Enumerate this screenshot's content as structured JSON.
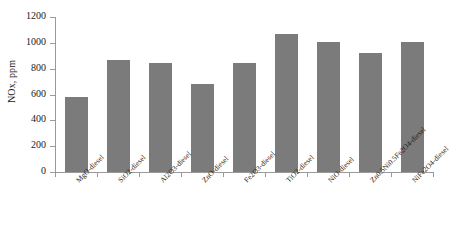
{
  "chart_data": {
    "type": "bar",
    "title": "",
    "subtitle": "",
    "xlabel": "",
    "ylabel": "NOx, ppm",
    "ylim": [
      0,
      1200
    ],
    "ytick_interval": 200,
    "yticks": [
      0,
      200,
      400,
      600,
      800,
      1000,
      1200
    ],
    "ytick_labels": [
      "0",
      "200",
      "400",
      "600",
      "800",
      "1000",
      "1200"
    ],
    "grid": false,
    "legend": false,
    "legend_position": "none",
    "bar_color": "#7b7b7b",
    "axis_color": "#9a9a9a",
    "text_color": "#1a1a1a",
    "categories": [
      "MgO-diesel",
      "SiO2-diesel",
      "Al2O3-diesel",
      "ZnO-diesel",
      "Fe2O3-diesel",
      "TiO2-diesel",
      "NiO-diesel",
      "Zn0.5Ni0.5Fe2O4-diesel",
      "NiFe2O4-diesel"
    ],
    "values": [
      580,
      870,
      845,
      680,
      845,
      1070,
      1005,
      925,
      1005
    ]
  }
}
